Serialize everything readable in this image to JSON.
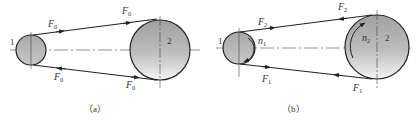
{
  "panels": [
    {
      "id": "a",
      "caption": "（a）",
      "small_pulley_label": "1",
      "large_pulley_label": "2",
      "tension_labels": {
        "upper_left": {
          "base": "F",
          "sub": "0"
        },
        "upper_right": {
          "base": "F",
          "sub": "0"
        },
        "lower_left": {
          "base": "F",
          "sub": "0"
        },
        "lower_right": {
          "base": "F",
          "sub": "0"
        }
      }
    },
    {
      "id": "b",
      "caption": "（b）",
      "small_pulley_label": "1",
      "large_pulley_label": "2",
      "speed_labels": {
        "small": {
          "base": "n",
          "sub": "1"
        },
        "large": {
          "base": "n",
          "sub": "2"
        }
      },
      "tension_labels": {
        "upper_left": {
          "base": "F",
          "sub": "2"
        },
        "upper_right": {
          "base": "F",
          "sub": "2"
        },
        "lower_left": {
          "base": "F",
          "sub": "1"
        },
        "lower_right": {
          "base": "F",
          "sub": "1"
        }
      }
    }
  ],
  "colors": {
    "line": "#222222",
    "pulley_fill_top": "#9a9a9a",
    "pulley_fill_bottom": "#f2f2f2"
  }
}
